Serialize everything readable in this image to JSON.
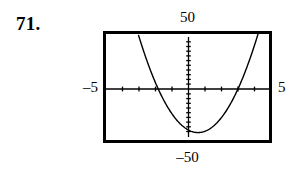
{
  "problem": {
    "number": "71."
  },
  "graph": {
    "labels": {
      "y_max": "50",
      "y_min": "–50",
      "x_min": "–5",
      "x_max": "5"
    },
    "colors": {
      "frame": "#000000",
      "curve": "#000000",
      "axis": "#000000",
      "background": "#ffffff"
    }
  },
  "chart_data": {
    "type": "line",
    "title": "",
    "xlabel": "",
    "ylabel": "",
    "xlim": [
      -5,
      5
    ],
    "ylim": [
      -50,
      50
    ],
    "grid": false,
    "legend": false,
    "axes": {
      "x_axis_at_y": 0,
      "y_axis_at_x": 0,
      "x_tick_interval": 1,
      "y_tick_interval": 5,
      "x_ticks": [
        -4,
        -3,
        -2,
        -1,
        1,
        2,
        3,
        4
      ],
      "y_ticks": [
        -45,
        -40,
        -35,
        -30,
        -25,
        -20,
        -15,
        -10,
        -5,
        5,
        10,
        15,
        20,
        25,
        30,
        35,
        40,
        45
      ]
    },
    "series": [
      {
        "name": "parabola",
        "shape": "upward parabola",
        "vertex": [
          0.65,
          -43
        ],
        "roots": [
          -1.85,
          3.15
        ],
        "x": [
          -3.1,
          -2.8,
          -2.5,
          -2.2,
          -1.9,
          -1.6,
          -1.3,
          -1.0,
          -0.7,
          -0.4,
          -0.1,
          0.2,
          0.5,
          0.65,
          0.8,
          1.1,
          1.4,
          1.7,
          2.0,
          2.3,
          2.6,
          2.9,
          3.2,
          3.5,
          3.8,
          4.1,
          4.4
        ],
        "y": [
          50,
          40.3,
          31.2,
          22.7,
          14.8,
          7.5,
          0.8,
          -5.3,
          -10.8,
          -15.7,
          -20.0,
          -23.7,
          -25.8,
          -26.0,
          -25.8,
          -24.4,
          -21.4,
          -17.0,
          -11.0,
          -3.5,
          5.5,
          16.0,
          28.0,
          41.5,
          50,
          50,
          50
        ]
      }
    ]
  }
}
